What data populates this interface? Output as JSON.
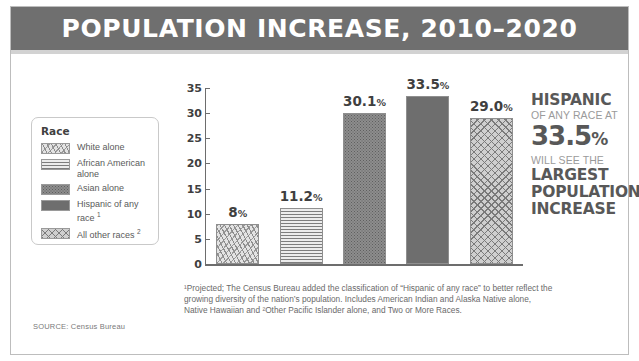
{
  "header": {
    "title": "POPULATION INCREASE, 2010–2020",
    "bar_color": "#6f6f6f",
    "text_color": "#ffffff"
  },
  "legend": {
    "title": "Race",
    "items": [
      {
        "label": "White alone",
        "pattern": "sparse-confetti",
        "swatch_color": "#e3e3e3"
      },
      {
        "label": "African American alone",
        "pattern": "horizontal-lines",
        "swatch_color": "#e9e9e9"
      },
      {
        "label": "Asian alone",
        "pattern": "dense-speckle",
        "swatch_color": "#8d8d8d"
      },
      {
        "label": "Hispanic of any race",
        "pattern": "solid",
        "swatch_color": "#6e6e6e",
        "footnote_marker": "1"
      },
      {
        "label": "All other races",
        "pattern": "crosshatch",
        "swatch_color": "#cfcfcf",
        "footnote_marker": "2"
      }
    ]
  },
  "chart_data": {
    "type": "bar",
    "title": "POPULATION INCREASE, 2010–2020",
    "xlabel": "",
    "ylabel": "",
    "ylim": [
      0,
      35
    ],
    "yticks": [
      0,
      5,
      10,
      15,
      20,
      25,
      30,
      35
    ],
    "grid": false,
    "legend_position": "left",
    "categories": [
      "White alone",
      "African American alone",
      "Asian alone",
      "Hispanic of any race",
      "All other races"
    ],
    "values": [
      8,
      11.2,
      30.1,
      33.5,
      29.0
    ],
    "value_labels": [
      "8",
      "11.2",
      "30.1",
      "33.5",
      "29.0"
    ],
    "value_label_suffix": "%",
    "bar_patterns": [
      "sparse-confetti",
      "horizontal-lines",
      "dense-speckle",
      "solid",
      "crosshatch"
    ],
    "bar_colors": [
      "#e3e3e3",
      "#e9e9e9",
      "#8d8d8d",
      "#6e6e6e",
      "#cfcfcf"
    ]
  },
  "callout": {
    "line1": "HISPANIC",
    "line2": "OF ANY RACE AT",
    "value": "33.5",
    "value_suffix": "%",
    "line4": "WILL SEE THE",
    "line5": "LARGEST",
    "line6": "POPULATION",
    "line7": "INCREASE",
    "strong_color": "#585858",
    "light_color": "#9a9a9a"
  },
  "footnote": {
    "text": "¹Projected; The Census Bureau added the classification of “Hispanic of any race” to better reflect the growing diversity of the nation’s population. Includes American Indian and Alaska Native alone, Native Hawaiian and ²Other Pacific Islander alone, and Two or More Races."
  },
  "source": {
    "text": "SOURCE: Census Bureau"
  }
}
